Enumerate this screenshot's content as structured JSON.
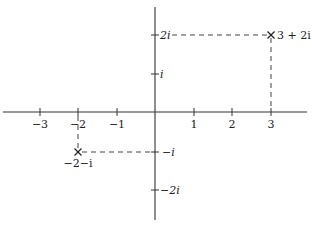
{
  "diagram": {
    "type": "complex-plane",
    "colors": {
      "axis": "#333333",
      "dash": "#444444",
      "text": "#222222"
    },
    "x_ticks": [
      {
        "value": -3,
        "label": "−3"
      },
      {
        "value": -2,
        "label": "−2"
      },
      {
        "value": -1,
        "label": "−1"
      },
      {
        "value": 1,
        "label": "1"
      },
      {
        "value": 2,
        "label": "2"
      },
      {
        "value": 3,
        "label": "3"
      }
    ],
    "y_ticks": [
      {
        "value": 2,
        "label": "2i"
      },
      {
        "value": 1,
        "label": "i"
      },
      {
        "value": -1,
        "label": "−i"
      },
      {
        "value": -2,
        "label": "−2i"
      }
    ],
    "points": [
      {
        "re": 3,
        "im": 2,
        "label": "3 + 2i",
        "marker": "x-mark"
      },
      {
        "re": -2,
        "im": -1,
        "label": "−2−i",
        "marker": "x-mark"
      }
    ]
  }
}
